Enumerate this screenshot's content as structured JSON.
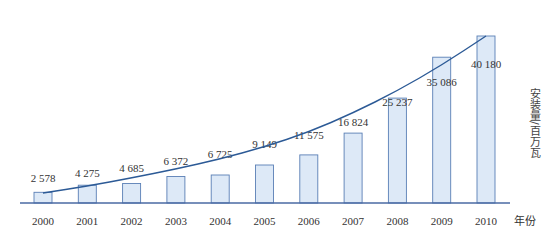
{
  "chart_data": {
    "type": "bar",
    "title": "",
    "categories": [
      "2000",
      "2001",
      "2002",
      "2003",
      "2004",
      "2005",
      "2006",
      "2007",
      "2008",
      "2009",
      "2010"
    ],
    "values": [
      2578,
      4275,
      4685,
      6372,
      6725,
      9149,
      11575,
      16824,
      25237,
      35086,
      40180
    ],
    "value_labels": [
      "2 578",
      "4 275",
      "4 685",
      "6 372",
      "6 725",
      "9 149",
      "11 575",
      "16 824",
      "25 237",
      "35 086",
      "40 180"
    ],
    "xlabel": "年份",
    "ylabel": "安装量/百万瓦",
    "ylim": [
      0,
      42000
    ],
    "grid": false,
    "legend": null,
    "trendline": "exponential",
    "colors": {
      "bar_fill": "#dde9f7",
      "bar_stroke": "#5a7fb5",
      "trend": "#2c5a96",
      "axis": "#4a6aa3"
    }
  }
}
